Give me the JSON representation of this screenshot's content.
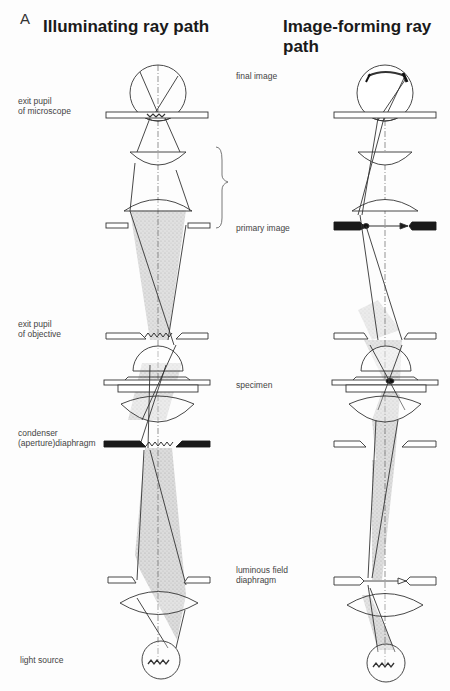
{
  "figure": {
    "panel_letter": "A",
    "left_title": "Illuminating ray path",
    "right_title": "Image-forming ray path"
  },
  "labels": {
    "exit_pupil_microscope_1": "exit pupil",
    "exit_pupil_microscope_2": "of microscope",
    "final_image": "final image",
    "primary_image": "primary image",
    "exit_pupil_objective_1": "exit pupil",
    "exit_pupil_objective_2": "of objective",
    "specimen": "specimen",
    "condenser_1": "condenser",
    "condenser_2": "(aperture)diaphragm",
    "luminous_1": "luminous field",
    "luminous_2": "diaphragm",
    "light_source": "light source"
  },
  "colors": {
    "line": "#333333",
    "shade": "#c8c8c8",
    "diaphragm": "#1a1a1a"
  }
}
